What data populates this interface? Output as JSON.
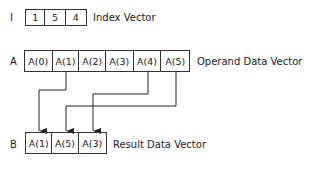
{
  "index_vector": {
    "label": "I",
    "values": [
      "1",
      "5",
      "4"
    ],
    "caption": "Index Vector"
  },
  "operand_vector": {
    "label": "A",
    "values": [
      "A(0)",
      "A(1)",
      "A(2)",
      "A(3)",
      "A(4)",
      "A(5)"
    ],
    "caption": "Operand Data Vector"
  },
  "result_vector": {
    "label": "B",
    "values": [
      "A(1)",
      "A(5)",
      "A(3)"
    ],
    "caption": "Result Data Vector"
  }
}
